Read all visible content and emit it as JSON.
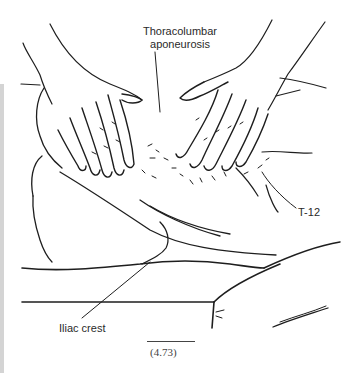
{
  "figure": {
    "number": "(4.73)",
    "labels": {
      "thoracolumbar_line1": "Thoracolumbar",
      "thoracolumbar_line2": "aponeurosis",
      "t12": "T-12",
      "iliac_crest": "Iliac crest"
    },
    "colors": {
      "ink": "#1e1e1e",
      "background": "#ffffff",
      "page_edge": "#d4d4d4"
    }
  }
}
